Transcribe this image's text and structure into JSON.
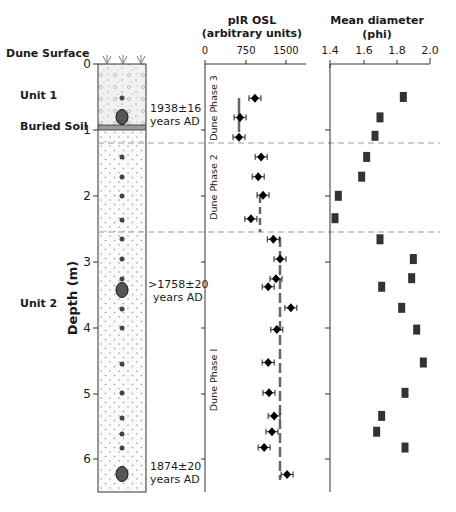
{
  "labels": {
    "dune_surface": "Dune Surface",
    "unit1": "Unit 1",
    "buried_soil": "Buried Soil",
    "unit2": "Unit 2",
    "depth_axis": "Depth (m)",
    "age1_line1": "1938±16",
    "age1_line2": "years AD",
    "age2_line1": ">1758±20",
    "age2_line2": "years AD",
    "age3_line1": "1874±20",
    "age3_line2": "years AD",
    "phase3": "Dune Phase 3",
    "phase2": "Dune Phase 2",
    "phase1": "Dune Phase I"
  },
  "chart_data": [
    {
      "type": "scatter",
      "title": "pIR OSL (arbitrary units)",
      "title_line1": "pIR OSL",
      "title_line2": "(arbitrary units)",
      "xlabel": "pIR OSL (arbitrary units)",
      "ylabel": "Depth (m)",
      "xlim": [
        0,
        2000
      ],
      "ylim": [
        6.5,
        0
      ],
      "xticks": [
        "0",
        "750",
        "1500"
      ],
      "yticks": [
        "0",
        "1",
        "2",
        "3",
        "4",
        "5",
        "6"
      ],
      "grid": false,
      "error_bars": true,
      "points": [
        {
          "depth": 0.52,
          "value": 925
        },
        {
          "depth": 0.81,
          "value": 650
        },
        {
          "depth": 1.11,
          "value": 630
        },
        {
          "depth": 1.41,
          "value": 1040
        },
        {
          "depth": 1.71,
          "value": 985
        },
        {
          "depth": 1.99,
          "value": 1075
        },
        {
          "depth": 2.35,
          "value": 850
        },
        {
          "depth": 2.66,
          "value": 1265
        },
        {
          "depth": 2.96,
          "value": 1390
        },
        {
          "depth": 3.26,
          "value": 1315
        },
        {
          "depth": 3.38,
          "value": 1170
        },
        {
          "depth": 3.7,
          "value": 1590
        },
        {
          "depth": 4.03,
          "value": 1330
        },
        {
          "depth": 4.53,
          "value": 1170
        },
        {
          "depth": 4.99,
          "value": 1185
        },
        {
          "depth": 5.34,
          "value": 1280
        },
        {
          "depth": 5.58,
          "value": 1240
        },
        {
          "depth": 5.82,
          "value": 1095
        },
        {
          "depth": 6.23,
          "value": 1520
        }
      ],
      "phase_means": [
        {
          "phase": "Dune Phase 3",
          "value": 640,
          "depth_range": [
            0.5,
            1.0
          ]
        },
        {
          "phase": "Dune Phase 2",
          "value": 1015,
          "depth_range": [
            2.0,
            2.55
          ]
        },
        {
          "phase": "Dune Phase I",
          "value": 1390,
          "depth_range": [
            2.6,
            6.3
          ]
        }
      ],
      "phase_boundaries_depth": [
        1.2,
        2.55
      ]
    },
    {
      "type": "scatter",
      "title": "Mean diameter (phi)",
      "title_line1": "Mean diameter",
      "title_line2": "(phi)",
      "xlabel": "Mean diameter (phi)",
      "ylabel": "Depth (m)",
      "xlim": [
        1.4,
        2.0
      ],
      "ylim": [
        6.5,
        0
      ],
      "xticks": [
        "1.4",
        "1.6",
        "1.8",
        "2.0"
      ],
      "grid": false,
      "points": [
        {
          "depth": 0.5,
          "value": 1.84
        },
        {
          "depth": 0.81,
          "value": 1.7
        },
        {
          "depth": 1.09,
          "value": 1.67
        },
        {
          "depth": 1.41,
          "value": 1.62
        },
        {
          "depth": 1.71,
          "value": 1.59
        },
        {
          "depth": 2.0,
          "value": 1.45
        },
        {
          "depth": 2.34,
          "value": 1.43
        },
        {
          "depth": 2.66,
          "value": 1.7
        },
        {
          "depth": 2.96,
          "value": 1.9
        },
        {
          "depth": 3.25,
          "value": 1.89
        },
        {
          "depth": 3.38,
          "value": 1.71
        },
        {
          "depth": 3.7,
          "value": 1.83
        },
        {
          "depth": 4.03,
          "value": 1.92
        },
        {
          "depth": 4.53,
          "value": 1.96
        },
        {
          "depth": 4.99,
          "value": 1.85
        },
        {
          "depth": 5.34,
          "value": 1.71
        },
        {
          "depth": 5.58,
          "value": 1.68
        },
        {
          "depth": 5.82,
          "value": 1.85
        }
      ]
    }
  ]
}
